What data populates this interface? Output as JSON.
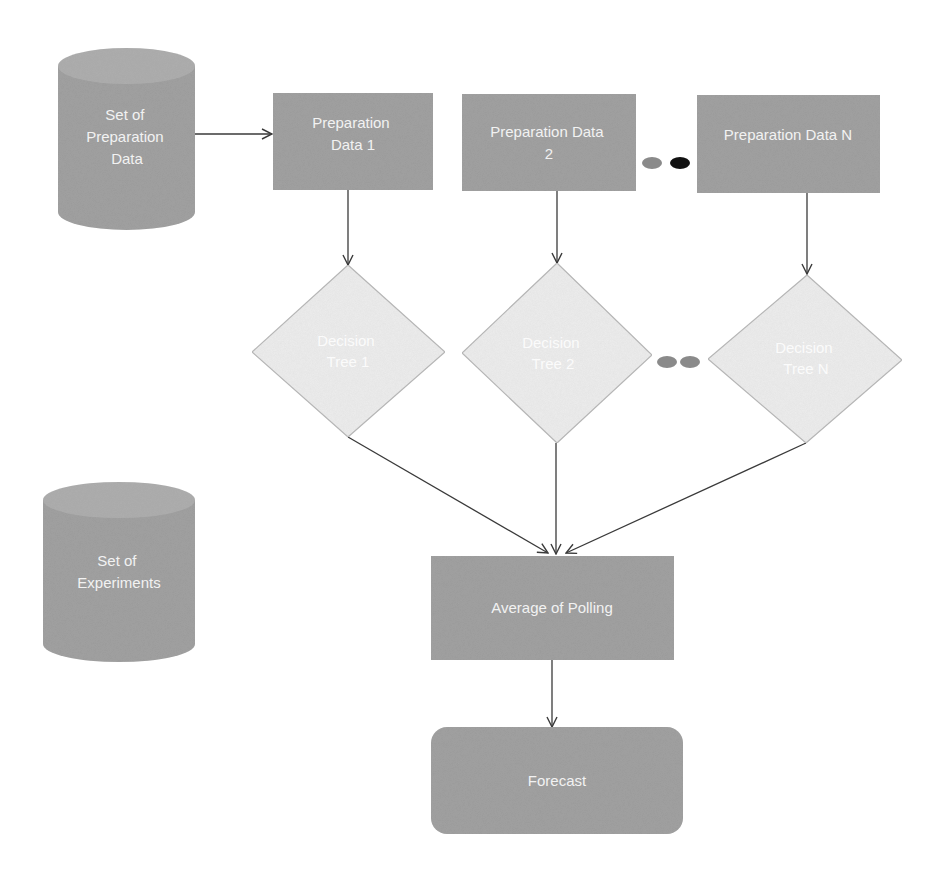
{
  "diagram": {
    "colors": {
      "box_fill": "#9a9a9a",
      "cylinder_fill": "#9a9a9a",
      "cylinder_top": "#a8a8a8",
      "diamond_fill": "#eeeeee",
      "diamond_stroke": "#b5b5b5",
      "edge": "#3a3a3a",
      "dot_gray": "#8a8a8a",
      "dot_black": "#111111"
    },
    "cylinders": [
      {
        "id": "set-of-preparation-data",
        "lines": [
          "Set of",
          "Preparation",
          "Data"
        ]
      },
      {
        "id": "set-of-experiments",
        "lines": [
          "Set of",
          "Experiments"
        ]
      }
    ],
    "preparation_boxes": [
      {
        "id": "preparation-data-1",
        "lines": [
          "Preparation",
          "Data 1"
        ]
      },
      {
        "id": "preparation-data-2",
        "lines": [
          "Preparation Data",
          "2"
        ]
      },
      {
        "id": "preparation-data-n",
        "lines": [
          "Preparation Data N"
        ]
      }
    ],
    "decision_trees": [
      {
        "id": "decision-tree-1",
        "lines": [
          "Decision",
          "Tree 1"
        ]
      },
      {
        "id": "decision-tree-2",
        "lines": [
          "Decision",
          "Tree 2"
        ]
      },
      {
        "id": "decision-tree-n",
        "lines": [
          "Decision",
          "Tree N"
        ]
      }
    ],
    "aggregate": {
      "id": "average-of-polling",
      "label": "Average of Polling"
    },
    "output": {
      "id": "forecast",
      "label": "Forecast"
    },
    "ellipsis_markers": {
      "top_row": [
        "gray",
        "black"
      ],
      "middle_row": [
        "gray",
        "gray"
      ]
    },
    "edges": [
      {
        "from": "set-of-preparation-data",
        "to": "preparation-data-1"
      },
      {
        "from": "preparation-data-1",
        "to": "decision-tree-1"
      },
      {
        "from": "preparation-data-2",
        "to": "decision-tree-2"
      },
      {
        "from": "preparation-data-n",
        "to": "decision-tree-n"
      },
      {
        "from": "decision-tree-1",
        "to": "average-of-polling"
      },
      {
        "from": "decision-tree-2",
        "to": "average-of-polling"
      },
      {
        "from": "decision-tree-n",
        "to": "average-of-polling"
      },
      {
        "from": "average-of-polling",
        "to": "forecast"
      }
    ]
  }
}
